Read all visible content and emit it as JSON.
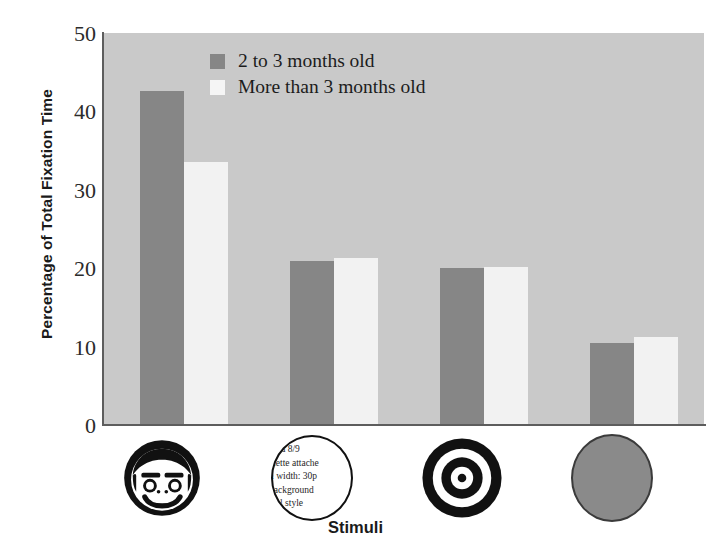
{
  "chart_data": {
    "type": "bar",
    "title": "",
    "xlabel": "Stimuli",
    "ylabel": "Percentage of Total Fixation Time",
    "ylim": [
      0,
      50
    ],
    "yticks": [
      0,
      10,
      20,
      30,
      40,
      50
    ],
    "ytick_labels": [
      "0",
      "10",
      "20",
      "30",
      "40",
      "50"
    ],
    "grid": false,
    "legend_position": "top-center",
    "categories": [
      "face",
      "text-circle",
      "bullseye",
      "plain-circle"
    ],
    "series": [
      {
        "name": "2 to 3 months old",
        "color": "#868686",
        "values": [
          42.6,
          20.9,
          20.0,
          10.5
        ]
      },
      {
        "name": "More than 3 months old",
        "color": "#f2f2f2",
        "values": [
          33.5,
          21.3,
          20.2,
          11.2
        ]
      }
    ]
  },
  "legend": {
    "entries": [
      {
        "label": "2 to 3 months old",
        "swatch": "dark"
      },
      {
        "label": "More than 3 months old",
        "swatch": "light"
      }
    ]
  },
  "axes": {
    "y_title": "Percentage of Total Fixation Time",
    "x_title": "Stimuli",
    "y_tick_0": "0",
    "y_tick_1": "10",
    "y_tick_2": "20",
    "y_tick_3": "30",
    "y_tick_4": "40",
    "y_tick_5": "50"
  },
  "stimuli": [
    {
      "name": "face-stimulus",
      "kind": "face",
      "label": ""
    },
    {
      "name": "text-circle-stimulus",
      "kind": "text-circle",
      "lines": [
        "nma 8/9",
        "alette attache",
        "n width: 30p",
        "background",
        "ical style"
      ]
    },
    {
      "name": "bullseye-stimulus",
      "kind": "bullseye",
      "label": ""
    },
    {
      "name": "plain-circle-stimulus",
      "kind": "plain-circle",
      "label": ""
    }
  ],
  "colors": {
    "plot_background": "#c9c9c9",
    "series_dark": "#868686",
    "series_light": "#f2f2f2",
    "axis": "#5d5d5d",
    "text": "#1a1a1a",
    "stimulus_plain_circle": "#8a8a8a"
  }
}
